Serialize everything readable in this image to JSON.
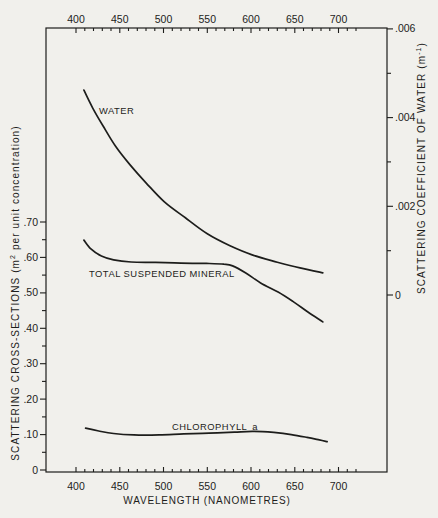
{
  "figure": {
    "background": "#f1f0ec",
    "ink": "#1d1d1b"
  },
  "axes": {
    "x": {
      "major_values": [
        400,
        450,
        500,
        550,
        600,
        650,
        700
      ],
      "major_labels": [
        "400",
        "450",
        "500",
        "550",
        "600",
        "650",
        "700"
      ],
      "major_step": 50,
      "major_max": 700,
      "minor_from": 400,
      "minor_to": 720,
      "minor_step": 10,
      "bottom_title": "WAVELENGTH (NANOMETRES)"
    },
    "left": {
      "title_pre": "SCATTERING CROSS-SECTIONS (m",
      "title_sup": "2",
      "title_post": " per unit concentration)",
      "major_values": [
        0.7,
        0.6,
        0.5,
        0.4,
        0.3,
        0.2,
        0.1,
        0
      ],
      "tick_labels": [
        ".70",
        ".60",
        ".50",
        ".40",
        ".30",
        ".20",
        ".10",
        "0"
      ],
      "minor_values": [
        0.65,
        0.55,
        0.45,
        0.35,
        0.25,
        0.15,
        0.05
      ]
    },
    "right": {
      "title_pre": "SCATTERING COEFFICIENT OF WATER (m",
      "title_sup": "-1",
      "title_post": ")",
      "major_values": [
        0.006,
        0.004,
        0.002,
        0
      ],
      "tick_labels": [
        ".006",
        ".004",
        ".002",
        "0"
      ],
      "minor_values": [
        0.005,
        0.003,
        0.001
      ]
    }
  },
  "curve_labels": {
    "water": "WATER",
    "mineral": "TOTAL SUSPENDED MINERAL",
    "chlorophyll": "CHLOROPHYLL",
    "chlorophyll_suffix": "a"
  },
  "chart_data": {
    "type": "line",
    "title": "",
    "xlabel": "WAVELENGTH (NANOMETRES)",
    "ylabel_left": "SCATTERING CROSS-SECTIONS (m2 per unit concentration)",
    "ylabel_right": "SCATTERING COEFFICIENT OF WATER (m-1)",
    "x_range_labeled": [
      400,
      700
    ],
    "left_range_labeled": [
      0,
      0.7
    ],
    "right_range_labeled": [
      0,
      0.006
    ],
    "grid": false,
    "legend": "labels drawn next to curves",
    "series": [
      {
        "name": "WATER",
        "axis": "right",
        "points": [
          [
            409,
            0.00462
          ],
          [
            419,
            0.00422
          ],
          [
            431,
            0.00381
          ],
          [
            445,
            0.00336
          ],
          [
            462,
            0.00293
          ],
          [
            480,
            0.00253
          ],
          [
            501,
            0.0021
          ],
          [
            525,
            0.00174
          ],
          [
            550,
            0.00138
          ],
          [
            576,
            0.00111
          ],
          [
            602,
            0.0009
          ],
          [
            630,
            0.00074
          ],
          [
            656,
            0.00061
          ],
          [
            682,
            0.0005
          ]
        ]
      },
      {
        "name": "TOTAL SUSPENDED MINERAL",
        "axis": "left",
        "points": [
          [
            409,
            0.649
          ],
          [
            417,
            0.624
          ],
          [
            429,
            0.604
          ],
          [
            443,
            0.593
          ],
          [
            463,
            0.587
          ],
          [
            491,
            0.586
          ],
          [
            520,
            0.584
          ],
          [
            549,
            0.583
          ],
          [
            569,
            0.581
          ],
          [
            579,
            0.576
          ],
          [
            594,
            0.556
          ],
          [
            611,
            0.528
          ],
          [
            631,
            0.502
          ],
          [
            649,
            0.474
          ],
          [
            665,
            0.446
          ],
          [
            682,
            0.418
          ]
        ]
      },
      {
        "name": "CHLOROPHYLL a",
        "axis": "left",
        "points": [
          [
            411,
            0.118
          ],
          [
            426,
            0.11
          ],
          [
            443,
            0.103
          ],
          [
            466,
            0.099
          ],
          [
            495,
            0.099
          ],
          [
            523,
            0.102
          ],
          [
            552,
            0.104
          ],
          [
            581,
            0.107
          ],
          [
            603,
            0.109
          ],
          [
            626,
            0.106
          ],
          [
            646,
            0.1
          ],
          [
            664,
            0.092
          ],
          [
            678,
            0.085
          ],
          [
            687,
            0.08
          ]
        ]
      }
    ]
  }
}
